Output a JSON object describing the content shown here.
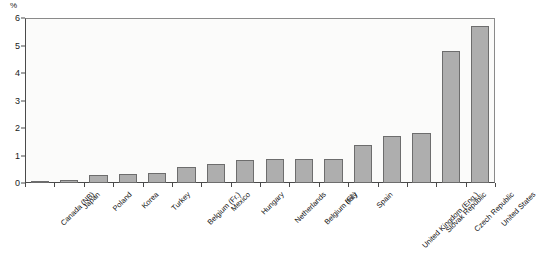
{
  "chart_data": {
    "type": "bar",
    "title": "",
    "xlabel": "",
    "ylabel": "%",
    "ylim": [
      0,
      6
    ],
    "ytick_labels": [
      "0",
      "1",
      "2",
      "3",
      "4",
      "5",
      "6"
    ],
    "yticks": [
      0,
      1,
      2,
      3,
      4,
      5,
      6
    ],
    "grid": false,
    "legend": "none",
    "categories": [
      "Canada (NB)",
      "Japan",
      "Poland",
      "Korea",
      "Turkey",
      "Belgium (Fr.)",
      "Mexico",
      "Hungary",
      "Netherlands",
      "Belgium (Fl.)",
      "Italy",
      "Spain",
      "United Kingdom (Eng.)",
      "Slovak Republic",
      "Czech Republic",
      "United States"
    ],
    "values": [
      0.02,
      0.1,
      0.28,
      0.32,
      0.36,
      0.58,
      0.68,
      0.85,
      0.88,
      0.88,
      0.86,
      1.4,
      1.7,
      1.82,
      4.8,
      5.7
    ],
    "bar_color": "#aeaeae",
    "bar_edge_color": "#6d6d6d",
    "axis_color": "#4a4a4a",
    "plot_background": "#fbfbfa"
  },
  "axis": {
    "unit_label": "%"
  }
}
